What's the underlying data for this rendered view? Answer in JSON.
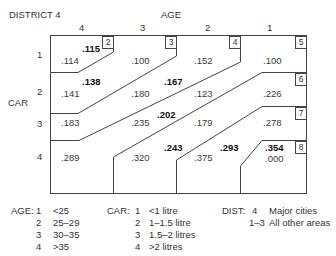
{
  "title": "DISTRICT 4",
  "age_axis": {
    "label": "AGE",
    "columns": [
      "4",
      "3",
      "2",
      "1"
    ]
  },
  "car_axis": {
    "label": "CAR",
    "rows": [
      "1",
      "2",
      "3",
      "4"
    ]
  },
  "regions": [
    {
      "id": "2"
    },
    {
      "id": "3"
    },
    {
      "id": "4"
    },
    {
      "id": "5"
    },
    {
      "id": "6"
    },
    {
      "id": "7"
    },
    {
      "id": "8"
    }
  ],
  "cells": {
    "r1": [
      ".114",
      ".100",
      ".152",
      ".100"
    ],
    "r2": [
      ".141",
      ".180",
      ".123",
      ".226"
    ],
    "r3": [
      ".183",
      ".235",
      ".179",
      ".278"
    ],
    "r4": [
      ".289",
      ".320",
      ".375",
      ".000"
    ]
  },
  "bold_values": {
    "region2": ".115",
    "region3": ".138",
    "region4": ".167",
    "region5": ".202",
    "region6": ".243",
    "region7": ".293",
    "region8": ".354"
  },
  "legend": {
    "age": {
      "label": "AGE:",
      "items": [
        {
          "code": "1",
          "desc": "<25"
        },
        {
          "code": "2",
          "desc": "25–29"
        },
        {
          "code": "3",
          "desc": "30–35"
        },
        {
          "code": "4",
          "desc": ">35"
        }
      ]
    },
    "car": {
      "label": "CAR:",
      "items": [
        {
          "code": "1",
          "desc": "<1 litre"
        },
        {
          "code": "2",
          "desc": "1–1.5 litre"
        },
        {
          "code": "3",
          "desc": "1.5–2 litres"
        },
        {
          "code": "4",
          "desc": ">2 litres"
        }
      ]
    },
    "dist": {
      "label": "DIST:",
      "items": [
        {
          "code": "4",
          "desc": "Major cities"
        },
        {
          "code": "1–3",
          "desc": "All other areas"
        }
      ]
    }
  }
}
